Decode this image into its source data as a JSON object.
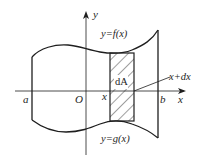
{
  "diagram": {
    "colors": {
      "stroke": "#1e1e1e",
      "background": "#ffffff",
      "hatch": "#2a2a2a"
    },
    "axes": {
      "x_label": "x",
      "y_label": "y",
      "origin_label": "O"
    },
    "labels": {
      "a": "a",
      "b": "b",
      "x": "x",
      "x_plus_dx": "x+dx",
      "dA": "dA",
      "upper_curve": "y=f(x)",
      "lower_curve": "y=g(x)"
    },
    "elements": [
      {
        "name": "upper-curve",
        "label": "y=f(x)"
      },
      {
        "name": "lower-curve",
        "label": "y=g(x)"
      },
      {
        "name": "area-strip",
        "label": "dA"
      },
      {
        "name": "left-boundary",
        "label": "a"
      },
      {
        "name": "right-boundary",
        "label": "b"
      }
    ]
  }
}
